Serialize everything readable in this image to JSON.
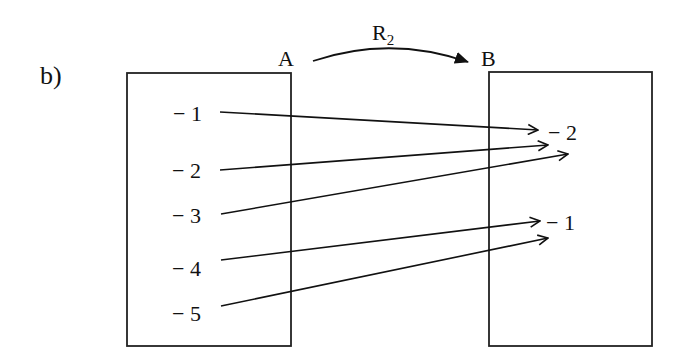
{
  "part_label": "b)",
  "relation": {
    "name": "R",
    "subscript": "2"
  },
  "set_a": {
    "label": "A",
    "elements": [
      "− 1",
      "− 2",
      "− 3",
      "− 4",
      "− 5"
    ]
  },
  "set_b": {
    "label": "B",
    "elements": [
      "− 2",
      "− 1"
    ]
  },
  "mappings": [
    {
      "from": "-1",
      "to": "-2"
    },
    {
      "from": "-2",
      "to": "-2"
    },
    {
      "from": "-3",
      "to": "-2"
    },
    {
      "from": "-4",
      "to": "-1"
    },
    {
      "from": "-5",
      "to": "-1"
    }
  ]
}
